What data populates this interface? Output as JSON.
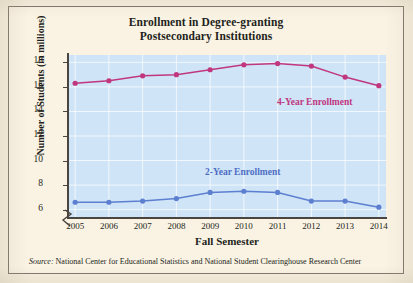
{
  "title_line1": "Enrollment in Degree-granting",
  "title_line2": "Postsecondary Institutions",
  "source_word": "Source:",
  "source_text": "National Center for Educational Statistics and National Student Clearinghouse Research Center",
  "labels": {
    "four_year": "4-Year Enrollment",
    "two_year": "2-Year Enrollment"
  },
  "colors": {
    "four_year": "#c0377f",
    "two_year": "#5d7fd0",
    "plot_background": "#cfe4f7",
    "page_background": "#f7efdf",
    "axis": "#4b4540"
  },
  "chart_data": {
    "type": "line",
    "title": "Enrollment in Degree-granting Postsecondary Institutions",
    "xlabel": "Fall Semester",
    "ylabel": "Number of Students (in millions)",
    "categories": [
      2005,
      2006,
      2007,
      2008,
      2009,
      2010,
      2011,
      2012,
      2013,
      2014
    ],
    "xtick_labels": [
      "2005",
      "2006",
      "2007",
      "2008",
      "2009",
      "2010",
      "2011",
      "2012",
      "2013",
      "2014"
    ],
    "ytick_labels": [
      "6",
      "8",
      "10",
      "12",
      "14",
      "16",
      "18"
    ],
    "ytick_values": [
      6,
      8,
      10,
      12,
      14,
      16,
      18
    ],
    "ylim": [
      5.4,
      18.6
    ],
    "y_axis_break": true,
    "grid": true,
    "legend": "inline-labels",
    "series": [
      {
        "name": "4-Year Enrollment",
        "color": "#c0377f",
        "values": [
          16.3,
          16.5,
          16.9,
          17.0,
          17.4,
          17.8,
          17.9,
          17.7,
          16.8,
          16.1
        ]
      },
      {
        "name": "2-Year Enrollment",
        "color": "#5d7fd0",
        "values": [
          6.6,
          6.6,
          6.7,
          6.9,
          7.4,
          7.5,
          7.4,
          6.7,
          6.7,
          6.2
        ]
      }
    ]
  }
}
